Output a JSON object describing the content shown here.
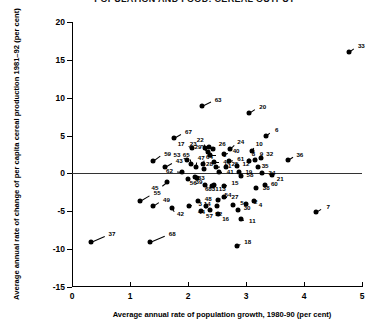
{
  "title": "POPULATION AND FOOD: CEREAL OUTPUT",
  "chart_data": {
    "type": "scatter",
    "title": "POPULATION AND FOOD: CEREAL OUTPUT",
    "xlabel": "Average annual rate of population growth, 1980-90 (per cent)",
    "ylabel": "Average annual rate of change of per capita cereal production 1981–92 (per cent)",
    "xlim": [
      0,
      5
    ],
    "ylim": [
      -15,
      20
    ],
    "xticks": [
      0,
      1,
      2,
      3,
      4,
      5
    ],
    "yticks": [
      -15,
      -10,
      -5,
      0,
      5,
      10,
      15,
      20
    ],
    "xtick_labels": [
      "0",
      "1",
      "2",
      "3",
      "4",
      "5"
    ],
    "ytick_labels": [
      "-15",
      "-10",
      "-5",
      "0",
      "5",
      "10",
      "15",
      "20"
    ],
    "grid": false,
    "legend": "none",
    "reference_line": {
      "axis": "y",
      "value": 0
    },
    "point_label_position": "upper-right with leader line",
    "points": [
      {
        "label": "37",
        "x": 0.32,
        "y": -9.0,
        "lx": 0.62,
        "ly": -8.0
      },
      {
        "label": "68",
        "x": 1.35,
        "y": -9.0,
        "lx": 1.66,
        "ly": -8.0
      },
      {
        "label": "55",
        "x": 1.18,
        "y": -3.6,
        "lx": 1.4,
        "ly": -2.6
      },
      {
        "label": "49",
        "x": 1.4,
        "y": -4.3,
        "lx": 1.56,
        "ly": -3.5
      },
      {
        "label": "59",
        "x": 1.4,
        "y": 1.6,
        "lx": 1.58,
        "ly": 2.6
      },
      {
        "label": "43",
        "x": 1.6,
        "y": 0.9,
        "lx": 1.78,
        "ly": 1.7
      },
      {
        "label": "45",
        "x": 1.63,
        "y": -1.1,
        "lx": 1.5,
        "ly": -1.9
      },
      {
        "label": "42",
        "x": 1.72,
        "y": -4.5,
        "lx": 1.8,
        "ly": -5.4
      },
      {
        "label": "62",
        "x": 1.9,
        "y": 0.2,
        "lx": 1.75,
        "ly": 0.3
      },
      {
        "label": "53",
        "x": 1.99,
        "y": 1.8,
        "lx": 1.88,
        "ly": 2.4
      },
      {
        "label": "67",
        "x": 1.76,
        "y": 4.7,
        "lx": 1.94,
        "ly": 5.5
      },
      {
        "label": "65",
        "x": 2.06,
        "y": 1.2,
        "lx": 2.04,
        "ly": 2.4
      },
      {
        "label": "47",
        "x": 2.14,
        "y": 0.9,
        "lx": 2.16,
        "ly": 2.1
      },
      {
        "label": "17",
        "x": 2.07,
        "y": 3.3,
        "lx": 1.95,
        "ly": 3.9
      },
      {
        "label": "39",
        "x": 2.12,
        "y": -0.5,
        "lx": 2.12,
        "ly": -1.1
      },
      {
        "label": "56",
        "x": 2.0,
        "y": -0.7,
        "lx": 2.02,
        "ly": -1.3
      },
      {
        "label": "3",
        "x": 2.02,
        "y": -4.3,
        "lx": 2.14,
        "ly": -4.0
      },
      {
        "label": "48",
        "x": 2.18,
        "y": -3.7,
        "lx": 2.28,
        "ly": -3.4
      },
      {
        "label": "44",
        "x": 2.31,
        "y": -4.3,
        "lx": 2.3,
        "ly": -5.1
      },
      {
        "label": "64",
        "x": 2.26,
        "y": 1.2,
        "lx": 2.3,
        "ly": 2.2
      },
      {
        "label": "28",
        "x": 2.28,
        "y": 0.6,
        "lx": 2.3,
        "ly": 1.2
      },
      {
        "label": "22",
        "x": 2.3,
        "y": 3.4,
        "lx": 2.28,
        "ly": 4.4
      },
      {
        "label": "29",
        "x": 2.34,
        "y": 2.8,
        "lx": 2.24,
        "ly": 3.5
      },
      {
        "label": "23",
        "x": 2.36,
        "y": 3.5,
        "lx": 2.16,
        "ly": 3.9
      },
      {
        "label": "1",
        "x": 2.38,
        "y": 2.4,
        "lx": 2.56,
        "ly": 2.4
      },
      {
        "label": "26",
        "x": 2.43,
        "y": 3.2,
        "lx": 2.52,
        "ly": 3.9
      },
      {
        "label": "63",
        "x": 2.24,
        "y": 8.9,
        "lx": 2.45,
        "ly": 9.7
      },
      {
        "label": "46",
        "x": 2.44,
        "y": 1.5,
        "lx": 2.6,
        "ly": 1.5
      },
      {
        "label": "31",
        "x": 2.3,
        "y": -1.5,
        "lx": 2.4,
        "ly": -2.1
      },
      {
        "label": "13",
        "x": 2.42,
        "y": -1.6,
        "lx": 2.52,
        "ly": -2.1
      },
      {
        "label": "40",
        "x": 2.62,
        "y": 2.6,
        "lx": 2.76,
        "ly": 2.9
      },
      {
        "label": "61",
        "x": 2.7,
        "y": 1.7,
        "lx": 2.84,
        "ly": 1.9
      },
      {
        "label": "51",
        "x": 2.49,
        "y": 0.9,
        "lx": 2.62,
        "ly": 1.0
      },
      {
        "label": "25",
        "x": 2.66,
        "y": 0.8,
        "lx": 2.74,
        "ly": 1.2
      },
      {
        "label": "41",
        "x": 2.54,
        "y": 0.2,
        "lx": 2.66,
        "ly": 0.2
      },
      {
        "label": "12",
        "x": 2.85,
        "y": 1.0,
        "lx": 2.93,
        "ly": 1.3
      },
      {
        "label": "19",
        "x": 2.88,
        "y": 0.2,
        "lx": 2.98,
        "ly": 0.2
      },
      {
        "label": "68b",
        "x": 2.44,
        "y": -1.5,
        "lx": 2.42,
        "ly": -2.1
      },
      {
        "label": "58",
        "x": 2.92,
        "y": -0.3,
        "lx": 3.0,
        "ly": -0.2
      },
      {
        "label": "15",
        "x": 2.62,
        "y": -1.6,
        "lx": 2.74,
        "ly": -1.3
      },
      {
        "label": "54",
        "x": 2.52,
        "y": -3.5,
        "lx": 2.62,
        "ly": -2.9
      },
      {
        "label": "27",
        "x": 2.62,
        "y": -3.1,
        "lx": 2.74,
        "ly": -3.1
      },
      {
        "label": "14",
        "x": 2.5,
        "y": -4.3,
        "lx": 2.4,
        "ly": -4.0
      },
      {
        "label": "52",
        "x": 2.38,
        "y": -4.8,
        "lx": 2.46,
        "ly": -5.4
      },
      {
        "label": "16",
        "x": 2.52,
        "y": -5.4,
        "lx": 2.58,
        "ly": -6.0
      },
      {
        "label": "5",
        "x": 2.78,
        "y": -4.2,
        "lx": 2.86,
        "ly": -3.9
      },
      {
        "label": "30",
        "x": 2.86,
        "y": -4.8,
        "lx": 2.95,
        "ly": -4.5
      },
      {
        "label": "2",
        "x": 3.0,
        "y": -4.0,
        "lx": 3.1,
        "ly": -3.8
      },
      {
        "label": "11",
        "x": 2.92,
        "y": -6.0,
        "lx": 3.04,
        "ly": -6.3
      },
      {
        "label": "18",
        "x": 2.84,
        "y": -9.6,
        "lx": 2.96,
        "ly": -9.0
      },
      {
        "label": "57",
        "x": 2.22,
        "y": -5.0,
        "lx": 2.3,
        "ly": -5.6
      },
      {
        "label": "10",
        "x": 3.1,
        "y": 3.0,
        "lx": 3.16,
        "ly": 3.9
      },
      {
        "label": "8",
        "x": 3.06,
        "y": 1.7,
        "lx": 3.06,
        "ly": 2.6
      },
      {
        "label": "9",
        "x": 3.15,
        "y": 1.8,
        "lx": 3.2,
        "ly": 2.6
      },
      {
        "label": "32",
        "x": 3.26,
        "y": 2.0,
        "lx": 3.34,
        "ly": 2.6
      },
      {
        "label": "35",
        "x": 3.2,
        "y": 0.8,
        "lx": 3.26,
        "ly": 1.0
      },
      {
        "label": "34",
        "x": 3.28,
        "y": 0.0,
        "lx": 3.38,
        "ly": 0.1
      },
      {
        "label": "21",
        "x": 3.45,
        "y": -0.2,
        "lx": 3.52,
        "ly": -0.7
      },
      {
        "label": "60",
        "x": 3.32,
        "y": -1.5,
        "lx": 3.42,
        "ly": -1.4
      },
      {
        "label": "38",
        "x": 3.18,
        "y": -1.9,
        "lx": 3.28,
        "ly": -1.9
      },
      {
        "label": "4",
        "x": 3.14,
        "y": -3.6,
        "lx": 3.18,
        "ly": -4.2
      },
      {
        "label": "36",
        "x": 3.72,
        "y": 1.8,
        "lx": 3.86,
        "ly": 2.5
      },
      {
        "label": "20",
        "x": 3.06,
        "y": 8.0,
        "lx": 3.22,
        "ly": 8.8
      },
      {
        "label": "6",
        "x": 3.34,
        "y": 5.0,
        "lx": 3.46,
        "ly": 5.8
      },
      {
        "label": "24",
        "x": 2.72,
        "y": 3.2,
        "lx": 2.84,
        "ly": 4.1
      },
      {
        "label": "7",
        "x": 4.2,
        "y": -5.1,
        "lx": 4.35,
        "ly": -4.4
      },
      {
        "label": "33",
        "x": 4.78,
        "y": 16.0,
        "lx": 4.92,
        "ly": 16.8
      },
      {
        "label": "33b",
        "x": 2.16,
        "y": -0.6,
        "lx": 2.16,
        "ly": -0.6
      }
    ]
  }
}
